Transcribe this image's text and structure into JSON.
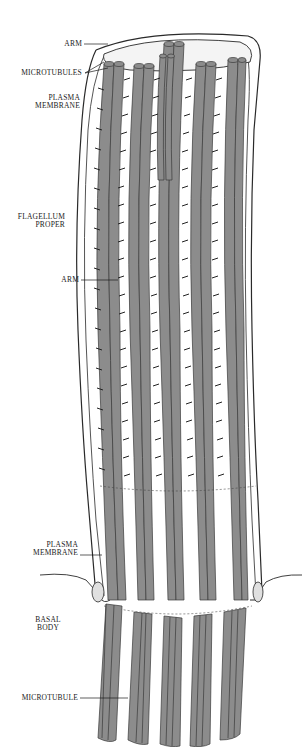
{
  "figure": {
    "colors": {
      "microtubule": "#8c8c8c",
      "microtubule_edge": "#3a3a3a",
      "membrane": "#f2f2f2",
      "membrane_edge": "#2a2a2a",
      "arm": "#222222",
      "background": "#ffffff"
    }
  },
  "labels": {
    "arm_top": "ARM",
    "microtubules": "MICROTUBULES",
    "plasma_membrane_top_1": "PLASMA",
    "plasma_membrane_top_2": "MEMBRANE",
    "flagellum_proper_1": "FLAGELLUM",
    "flagellum_proper_2": "PROPER",
    "arm_mid": "ARM",
    "plasma_membrane_bottom_1": "PLASMA",
    "plasma_membrane_bottom_2": "MEMBRANE",
    "basal_body_1": "BASAL",
    "basal_body_2": "BODY",
    "microtubule": "MICROTUBULE"
  }
}
